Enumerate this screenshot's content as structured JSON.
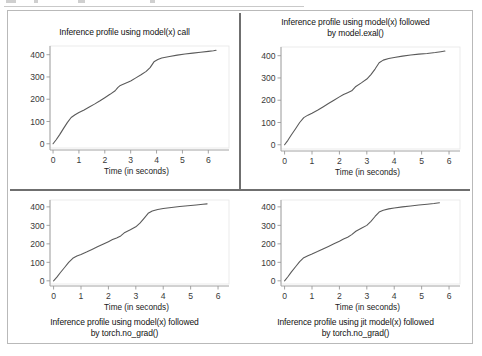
{
  "figure": {
    "panel_background": "#ffffff",
    "panel_border_color": "#b9b9b9",
    "divider_color": "#6f6f6f",
    "line_color": "#5a5a5a",
    "axis_color": "#9a9a9a",
    "tick_label_color": "#3a3a3a"
  },
  "charts": [
    {
      "position": "top-left",
      "title_line_1": "Inference profile using model(x) call",
      "title_line_2": "",
      "title_placement": "above",
      "chart_data": {
        "type": "line",
        "title": "Inference profile using model(x) call",
        "xlabel": "Time (in seconds)",
        "ylabel": "",
        "xlim": [
          -0.35,
          6.8
        ],
        "ylim": [
          -28,
          448
        ],
        "xticks": [
          0,
          1,
          2,
          3,
          4,
          5,
          6
        ],
        "yticks": [
          0,
          100,
          200,
          300,
          400
        ],
        "grid": false,
        "legend": false,
        "series": [
          {
            "name": "cumulative inferences",
            "x": [
              0.0,
              0.12,
              0.25,
              0.4,
              0.55,
              0.7,
              0.85,
              1.0,
              1.2,
              1.4,
              1.6,
              1.8,
              2.0,
              2.2,
              2.4,
              2.5,
              2.6,
              2.8,
              3.0,
              3.2,
              3.4,
              3.6,
              3.75,
              3.9,
              4.05,
              4.2,
              4.5,
              4.8,
              5.1,
              5.4,
              5.7,
              6.0,
              6.2,
              6.3
            ],
            "y": [
              0,
              18,
              40,
              68,
              95,
              118,
              130,
              140,
              152,
              165,
              178,
              192,
              207,
              222,
              238,
              252,
              262,
              272,
              282,
              296,
              310,
              325,
              342,
              368,
              378,
              385,
              392,
              398,
              403,
              407,
              411,
              415,
              418,
              420
            ]
          }
        ]
      }
    },
    {
      "position": "top-right",
      "title_line_1": "Inference profile using model(x) followed",
      "title_line_2": "by model.exal()",
      "title_placement": "above",
      "chart_data": {
        "type": "line",
        "title": "Inference profile using model(x) followed by model.exal()",
        "xlabel": "Time (in seconds)",
        "ylabel": "",
        "xlim": [
          -0.35,
          6.4
        ],
        "ylim": [
          -28,
          448
        ],
        "xticks": [
          0,
          1,
          2,
          3,
          4,
          5,
          6
        ],
        "yticks": [
          0,
          100,
          200,
          300,
          400
        ],
        "grid": false,
        "legend": false,
        "series": [
          {
            "name": "cumulative inferences",
            "x": [
              0.0,
              0.12,
              0.25,
              0.4,
              0.55,
              0.7,
              0.85,
              1.0,
              1.2,
              1.4,
              1.6,
              1.8,
              2.0,
              2.15,
              2.3,
              2.45,
              2.6,
              2.8,
              3.0,
              3.15,
              3.3,
              3.45,
              3.6,
              3.8,
              4.0,
              4.3,
              4.6,
              4.9,
              5.2,
              5.5,
              5.7,
              5.85
            ],
            "y": [
              0,
              20,
              45,
              72,
              100,
              122,
              133,
              142,
              155,
              170,
              185,
              200,
              215,
              226,
              234,
              242,
              262,
              278,
              295,
              315,
              340,
              368,
              380,
              387,
              392,
              398,
              403,
              407,
              410,
              414,
              418,
              421
            ]
          }
        ]
      }
    },
    {
      "position": "bottom-left",
      "title_line_1": "Inference profile using model(x) followed",
      "title_line_2": "by torch.no_grad()",
      "title_placement": "below",
      "chart_data": {
        "type": "line",
        "title": "Inference profile using model(x) followed by torch.no_grad()",
        "xlabel": "Time (in seconds)",
        "ylabel": "",
        "xlim": [
          -0.35,
          6.4
        ],
        "ylim": [
          -28,
          448
        ],
        "xticks": [
          0,
          1,
          2,
          3,
          4,
          5,
          6
        ],
        "yticks": [
          0,
          100,
          200,
          300,
          400
        ],
        "grid": false,
        "legend": false,
        "series": [
          {
            "name": "cumulative inferences",
            "x": [
              0.0,
              0.12,
              0.25,
              0.4,
              0.55,
              0.7,
              0.85,
              1.0,
              1.2,
              1.4,
              1.6,
              1.8,
              2.0,
              2.15,
              2.3,
              2.45,
              2.6,
              2.8,
              3.0,
              3.15,
              3.3,
              3.45,
              3.6,
              3.8,
              4.0,
              4.3,
              4.6,
              4.9,
              5.2,
              5.45,
              5.6
            ],
            "y": [
              0,
              20,
              45,
              72,
              100,
              122,
              134,
              143,
              156,
              170,
              184,
              198,
              212,
              223,
              232,
              243,
              262,
              276,
              292,
              312,
              338,
              365,
              378,
              386,
              391,
              397,
              402,
              406,
              410,
              414,
              416
            ]
          }
        ]
      }
    },
    {
      "position": "bottom-right",
      "title_line_1": "Inference profile using jit model(x) followed",
      "title_line_2": "by torch.no_grad()",
      "title_placement": "below",
      "chart_data": {
        "type": "line",
        "title": "Inference profile using jit model(x) followed by torch.no_grad()",
        "xlabel": "Time (in seconds)",
        "ylabel": "",
        "xlim": [
          -0.35,
          6.4
        ],
        "ylim": [
          -28,
          448
        ],
        "xticks": [
          0,
          1,
          2,
          3,
          4,
          5,
          6
        ],
        "yticks": [
          0,
          100,
          200,
          300,
          400
        ],
        "grid": false,
        "legend": false,
        "series": [
          {
            "name": "cumulative inferences",
            "x": [
              0.0,
              0.12,
              0.25,
              0.4,
              0.55,
              0.7,
              0.85,
              1.0,
              1.2,
              1.4,
              1.6,
              1.8,
              2.0,
              2.15,
              2.3,
              2.45,
              2.6,
              2.8,
              3.0,
              3.15,
              3.3,
              3.45,
              3.6,
              3.8,
              4.0,
              4.3,
              4.6,
              4.9,
              5.2,
              5.45,
              5.65
            ],
            "y": [
              0,
              22,
              48,
              76,
              104,
              125,
              136,
              145,
              158,
              172,
              186,
              200,
              214,
              226,
              236,
              250,
              268,
              284,
              300,
              322,
              348,
              372,
              382,
              389,
              394,
              400,
              405,
              410,
              414,
              418,
              422
            ]
          }
        ]
      }
    }
  ]
}
